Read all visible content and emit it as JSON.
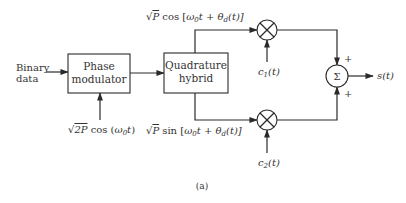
{
  "diagram": {
    "input_label_line1": "Binary",
    "input_label_line2": "data",
    "blocks": {
      "phase_modulator": {
        "line1": "Phase",
        "line2": "modulator"
      },
      "quadrature_hybrid": {
        "line1": "Quadrature",
        "line2": "hybrid"
      }
    },
    "carrier_input": {
      "sqrt": "√",
      "radicand": "2P",
      "func": " cos (",
      "omega": "ω",
      "sub0": "0",
      "t": "t",
      "close": ")"
    },
    "top_branch": {
      "sqrt": "√",
      "radicand": "P",
      "func": " cos [",
      "omega": "ω",
      "sub0": "0",
      "t": "t + ",
      "theta": "θ",
      "subd": "d",
      "tail": "(t)]"
    },
    "bottom_branch": {
      "sqrt": "√",
      "radicand": "P",
      "func": " sin [",
      "omega": "ω",
      "sub0": "0",
      "t": "t + ",
      "theta": "θ",
      "subd": "d",
      "tail": "(t)]"
    },
    "multiplier_symbol": "×",
    "code1": {
      "c": "c",
      "sub": "1",
      "arg": "(t)"
    },
    "code2": {
      "c": "c",
      "sub": "2",
      "arg": "(t)"
    },
    "summer_symbol": "Σ",
    "summer_plus_top": "+",
    "summer_plus_bottom": "+",
    "output_label": "s(t)",
    "caption": "(a)"
  }
}
